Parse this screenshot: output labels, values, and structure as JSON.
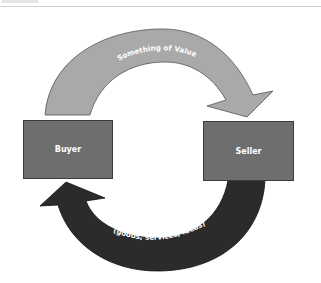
{
  "diagram": {
    "type": "exchange-cycle",
    "nodes": [
      {
        "id": "buyer",
        "label": "Buyer"
      },
      {
        "id": "seller",
        "label": "Seller"
      }
    ],
    "flows": [
      {
        "from": "buyer",
        "to": "seller",
        "title": "Something of Value",
        "detail": "(money, credit, labor, goods)",
        "color": "#a9a9a9"
      },
      {
        "from": "seller",
        "to": "buyer",
        "title": "Something of Value",
        "detail": "(goods, services, ideas)",
        "color": "#2b2b2b"
      }
    ]
  },
  "colors": {
    "box_fill": "#6e6e6e",
    "box_border": "#3c3c3c",
    "top_arrow": "#a9a9a9",
    "bottom_arrow": "#2b2b2b",
    "label_text": "#ffffff"
  }
}
